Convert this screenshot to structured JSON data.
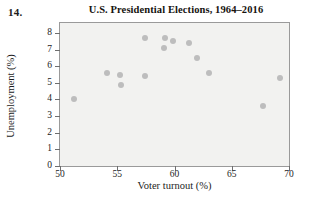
{
  "problem": {
    "number": "14."
  },
  "chart_data": {
    "type": "scatter",
    "title": "U.S. Presidential Elections, 1964–2016",
    "xlabel": "Voter turnout (%)",
    "ylabel": "Unemployment (%)",
    "xlim": [
      50,
      70
    ],
    "ylim": [
      0,
      8.6
    ],
    "xticks": [
      50,
      55,
      60,
      65,
      70
    ],
    "yticks": [
      0,
      1,
      2,
      3,
      4,
      5,
      6,
      7,
      8
    ],
    "xtick_labels": [
      "50",
      "55",
      "60",
      "65",
      "70"
    ],
    "ytick_labels": [
      "0",
      "1",
      "2",
      "3",
      "4",
      "5",
      "6",
      "7",
      "8"
    ],
    "grid": false,
    "legend": null,
    "marker_color": "#bdbdbd",
    "plot_background": "#f2f2f0",
    "points": [
      {
        "x": 51.2,
        "y": 4.0
      },
      {
        "x": 54.1,
        "y": 5.6
      },
      {
        "x": 55.2,
        "y": 5.5
      },
      {
        "x": 55.3,
        "y": 4.9
      },
      {
        "x": 57.4,
        "y": 7.7
      },
      {
        "x": 57.4,
        "y": 5.4
      },
      {
        "x": 59.1,
        "y": 7.1
      },
      {
        "x": 59.2,
        "y": 7.7
      },
      {
        "x": 59.9,
        "y": 7.5
      },
      {
        "x": 61.3,
        "y": 7.4
      },
      {
        "x": 62.0,
        "y": 6.5
      },
      {
        "x": 63.0,
        "y": 5.6
      },
      {
        "x": 67.7,
        "y": 3.6
      },
      {
        "x": 69.2,
        "y": 5.3
      }
    ]
  }
}
